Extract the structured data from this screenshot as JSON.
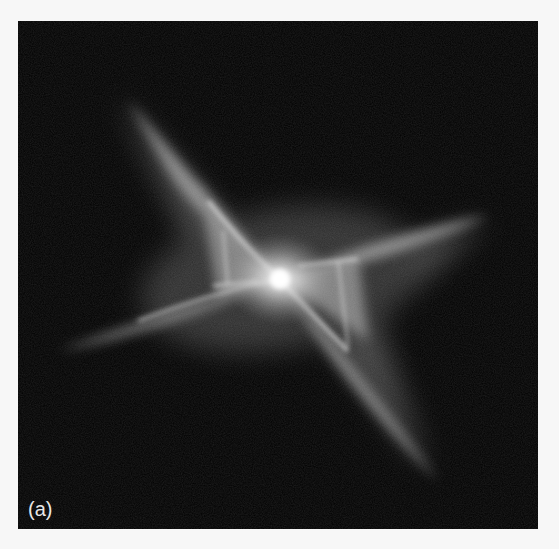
{
  "figure": {
    "panel_label": "(a)",
    "colors": {
      "background": "#000000",
      "nebula_core": "#ffffff",
      "page": "#f7f7f7"
    }
  }
}
